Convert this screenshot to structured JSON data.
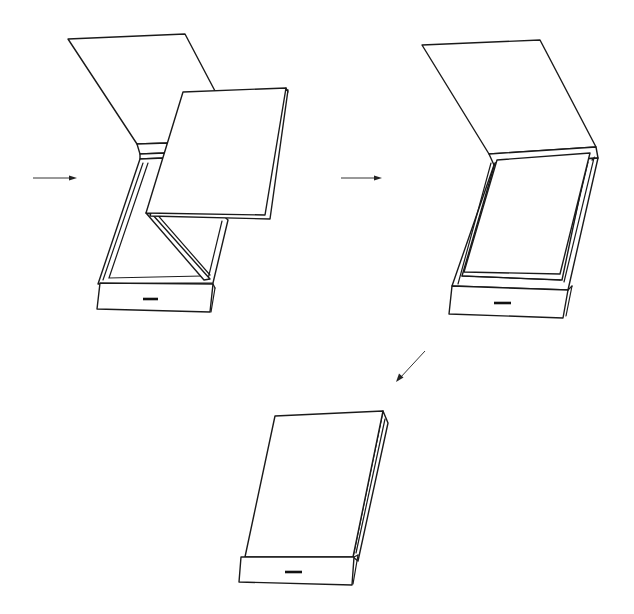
{
  "diagram": {
    "title": "Folding box assembly sequence",
    "type": "patent-style line drawing",
    "colors": {
      "line": "#1a1a1a",
      "background": "#ffffff",
      "arrow": "#333333"
    },
    "steps": [
      {
        "id": "step-1",
        "description": "Box open: lid flap raised, inner folded sheet partially unfolded in a Z-fold above the tray"
      },
      {
        "id": "step-2",
        "description": "Box open: lid flap raised, inner sheet laid flat in the tray"
      },
      {
        "id": "step-3",
        "description": "Box closed: lid folded over the tray, front drawer strip with slot visible"
      }
    ],
    "arrows": [
      {
        "id": "arrow-to-step-1",
        "direction": "right"
      },
      {
        "id": "arrow-to-step-2",
        "direction": "right"
      },
      {
        "id": "arrow-to-step-3",
        "direction": "down-left"
      }
    ]
  }
}
